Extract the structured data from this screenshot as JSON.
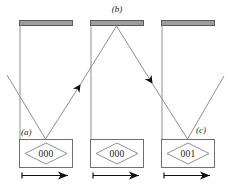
{
  "figure": {
    "background_color": "#ffffff",
    "line_color": "#8a8a8a",
    "dark_line_color": "#4d4d4d",
    "text_color": "#1a1a1a",
    "mirror_fill_color": "#9d9d9d",
    "mirror_stroke_color": "#5a5a5a",
    "arrow_fill_color": "#000000"
  },
  "panel_labels": {
    "a": "(a)",
    "b": "(b)",
    "c": "(c)"
  },
  "counters": [
    {
      "id": "counter-a",
      "value": "000"
    },
    {
      "id": "counter-b",
      "value": "000"
    },
    {
      "id": "counter-c",
      "value": "001"
    }
  ],
  "icons": {
    "mirror": "mirror-bar-icon",
    "ray": "light-ray-icon",
    "ray_arrow": "ray-direction-arrow-icon",
    "travel_arrow": "travel-direction-arrow-icon",
    "diamond": "counter-diamond-icon"
  }
}
